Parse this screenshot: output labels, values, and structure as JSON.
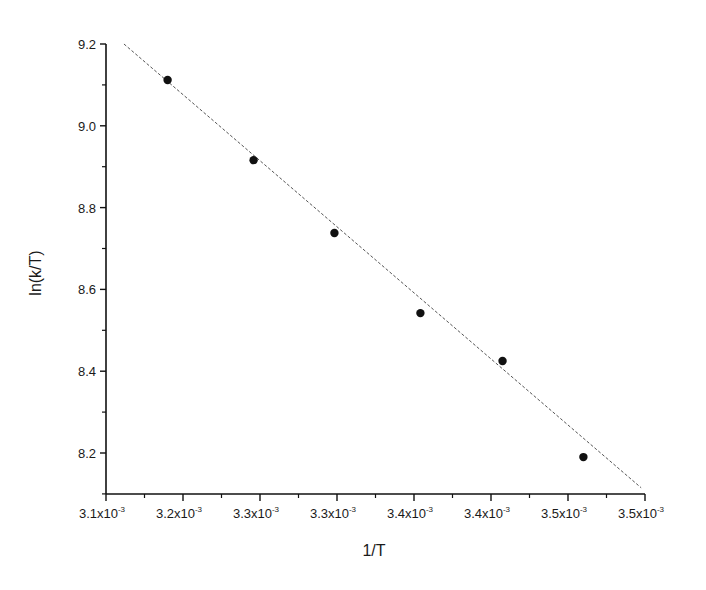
{
  "chart_data": {
    "type": "scatter",
    "title": "",
    "xlabel": "1/T",
    "ylabel": "ln(k/T)",
    "xlim": [
      0.00313,
      0.00355
    ],
    "ylim": [
      8.11,
      9.2
    ],
    "grid": false,
    "legend": null,
    "x_ticks": {
      "values": [
        0.00313,
        0.00319,
        0.00325,
        0.00331,
        0.00337,
        0.00343,
        0.00349,
        0.00355
      ],
      "labels": [
        "3.1x10-3",
        "3.2x10-3",
        "3.3x10-3",
        "3.3x10-3",
        "3.4x10-3",
        "3.4x10-3",
        "3.5x10-3",
        "3.5x10-3"
      ],
      "mantissas": [
        "3.1",
        "3.2",
        "3.3",
        "3.3",
        "3.4",
        "3.4",
        "3.5",
        "3.5"
      ],
      "exponent": "-3"
    },
    "y_ticks": {
      "values": [
        8.2,
        8.4,
        8.6,
        8.8,
        9.0,
        9.2
      ],
      "labels": [
        "8.2",
        "8.4",
        "8.6",
        "8.8",
        "9.0",
        "9.2"
      ]
    },
    "series": [
      {
        "name": "data",
        "kind": "scatter",
        "marker": "filled-circle",
        "color": "#111111",
        "x": [
          0.003178,
          0.003245,
          0.003308,
          0.003375,
          0.003439,
          0.003502
        ],
        "y": [
          9.112,
          8.916,
          8.738,
          8.542,
          8.425,
          8.19
        ]
      },
      {
        "name": "linear fit",
        "kind": "line",
        "style": "dashed",
        "color": "#555555",
        "x": [
          0.003144,
          0.003547
        ],
        "y": [
          9.2,
          8.115
        ]
      }
    ]
  },
  "axes": {
    "x_title": "1/T",
    "y_title": "ln(k/T)",
    "x_exponent": "-3"
  }
}
